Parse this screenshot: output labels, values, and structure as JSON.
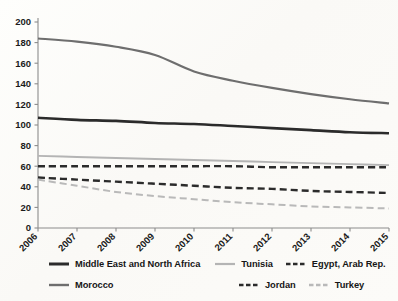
{
  "chart": {
    "type": "line",
    "title": "",
    "xlabel": "",
    "ylabel": "",
    "background": "#fdfdfb",
    "grid": false,
    "legend_position": "bottom",
    "axis_color": "#8c8c8c",
    "ylim": [
      0,
      200
    ],
    "yticks": [
      "0",
      "20",
      "40",
      "60",
      "80",
      "100",
      "120",
      "140",
      "160",
      "180",
      "200"
    ],
    "x": [
      "2006",
      "2007",
      "2008",
      "2009",
      "2010",
      "2011",
      "2012",
      "2013",
      "2014",
      "2015"
    ],
    "xtick_rotation": "-45",
    "series": [
      {
        "name": "Middle East and North Africa",
        "color": "#2b2b2b",
        "style": "solid",
        "width": 2.6,
        "values": [
          107,
          105,
          104,
          102,
          101,
          99,
          97,
          95,
          93,
          92
        ]
      },
      {
        "name": "Morocco",
        "color": "#6e6e6e",
        "style": "solid",
        "width": 2.2,
        "values": [
          184,
          181,
          176,
          168,
          152,
          143,
          136,
          130,
          125,
          121
        ]
      },
      {
        "name": "Tunisia",
        "color": "#b4b4b4",
        "style": "solid",
        "width": 1.9,
        "values": [
          70,
          69,
          68,
          67,
          66,
          65,
          64,
          63,
          62,
          61
        ]
      },
      {
        "name": "Jordan",
        "color": "#2b2b2b",
        "style": "dashed",
        "width": 2.4,
        "values": [
          49,
          47,
          45,
          43,
          41,
          39,
          38,
          36,
          35,
          34
        ]
      },
      {
        "name": "Egypt, Arab Rep.",
        "color": "#2b2b2b",
        "style": "dashed",
        "width": 2.4,
        "values": [
          60,
          60,
          60,
          60,
          60,
          60,
          59,
          59,
          59,
          59
        ]
      },
      {
        "name": "Turkey",
        "color": "#b9b9b9",
        "style": "dashed",
        "width": 2.0,
        "values": [
          47,
          41,
          35,
          31,
          28,
          25,
          23,
          21,
          20,
          19
        ]
      }
    ],
    "legend": [
      {
        "label": "Middle East and North Africa",
        "color": "#2b2b2b",
        "style": "solid",
        "width": 3.0
      },
      {
        "label": "Tunisia",
        "color": "#b4b4b4",
        "style": "solid",
        "width": 2.2
      },
      {
        "label": "Egypt, Arab Rep.",
        "color": "#2b2b2b",
        "style": "dashed",
        "width": 2.6
      },
      {
        "label": "Morocco",
        "color": "#6e6e6e",
        "style": "solid",
        "width": 2.4
      },
      {
        "label": "Jordan",
        "color": "#2b2b2b",
        "style": "dashed",
        "width": 2.6
      },
      {
        "label": "Turkey",
        "color": "#b9b9b9",
        "style": "dashed",
        "width": 2.4
      }
    ]
  }
}
